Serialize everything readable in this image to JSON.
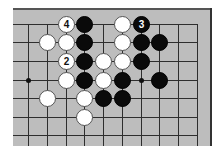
{
  "diagram": {
    "type": "go-board-fragment",
    "colors": {
      "board": "#bdbdbd",
      "line": "#2e2e2e",
      "black": "#0a0a0a",
      "white": "#ffffff"
    },
    "grid": {
      "columns_x": [
        28,
        47,
        66,
        84,
        103,
        122,
        141,
        159,
        178,
        197
      ],
      "rows_y": [
        24,
        42,
        61,
        80,
        98,
        117,
        135
      ]
    },
    "hoshi": [
      {
        "col": 0,
        "row": 3
      },
      {
        "col": 6,
        "row": 3
      }
    ],
    "stones": [
      {
        "color": "white",
        "col": 2,
        "row": 0,
        "label": "4"
      },
      {
        "color": "black",
        "col": 3,
        "row": 0,
        "label": ""
      },
      {
        "color": "white",
        "col": 5,
        "row": 0,
        "label": ""
      },
      {
        "color": "black",
        "col": 6,
        "row": 0,
        "label": "3"
      },
      {
        "color": "white",
        "col": 1,
        "row": 1,
        "label": ""
      },
      {
        "color": "white",
        "col": 2,
        "row": 1,
        "label": ""
      },
      {
        "color": "black",
        "col": 3,
        "row": 1,
        "label": ""
      },
      {
        "color": "white",
        "col": 5,
        "row": 1,
        "label": ""
      },
      {
        "color": "black",
        "col": 6,
        "row": 1,
        "label": ""
      },
      {
        "color": "black",
        "col": 7,
        "row": 1,
        "label": ""
      },
      {
        "color": "white",
        "col": 2,
        "row": 2,
        "label": "2"
      },
      {
        "color": "black",
        "col": 3,
        "row": 2,
        "label": ""
      },
      {
        "color": "white",
        "col": 4,
        "row": 2,
        "label": ""
      },
      {
        "color": "white",
        "col": 5,
        "row": 2,
        "label": ""
      },
      {
        "color": "black",
        "col": 6,
        "row": 2,
        "label": ""
      },
      {
        "color": "white",
        "col": 2,
        "row": 3,
        "label": ""
      },
      {
        "color": "black",
        "col": 3,
        "row": 3,
        "label": ""
      },
      {
        "color": "white",
        "col": 4,
        "row": 3,
        "label": ""
      },
      {
        "color": "black",
        "col": 5,
        "row": 3,
        "label": ""
      },
      {
        "color": "black",
        "col": 7,
        "row": 3,
        "label": ""
      },
      {
        "color": "white",
        "col": 1,
        "row": 4,
        "label": ""
      },
      {
        "color": "white",
        "col": 3,
        "row": 4,
        "label": ""
      },
      {
        "color": "black",
        "col": 4,
        "row": 4,
        "label": ""
      },
      {
        "color": "black",
        "col": 5,
        "row": 4,
        "label": ""
      },
      {
        "color": "white",
        "col": 3,
        "row": 5,
        "label": ""
      }
    ],
    "move_labels": [
      "2",
      "3",
      "4"
    ]
  }
}
